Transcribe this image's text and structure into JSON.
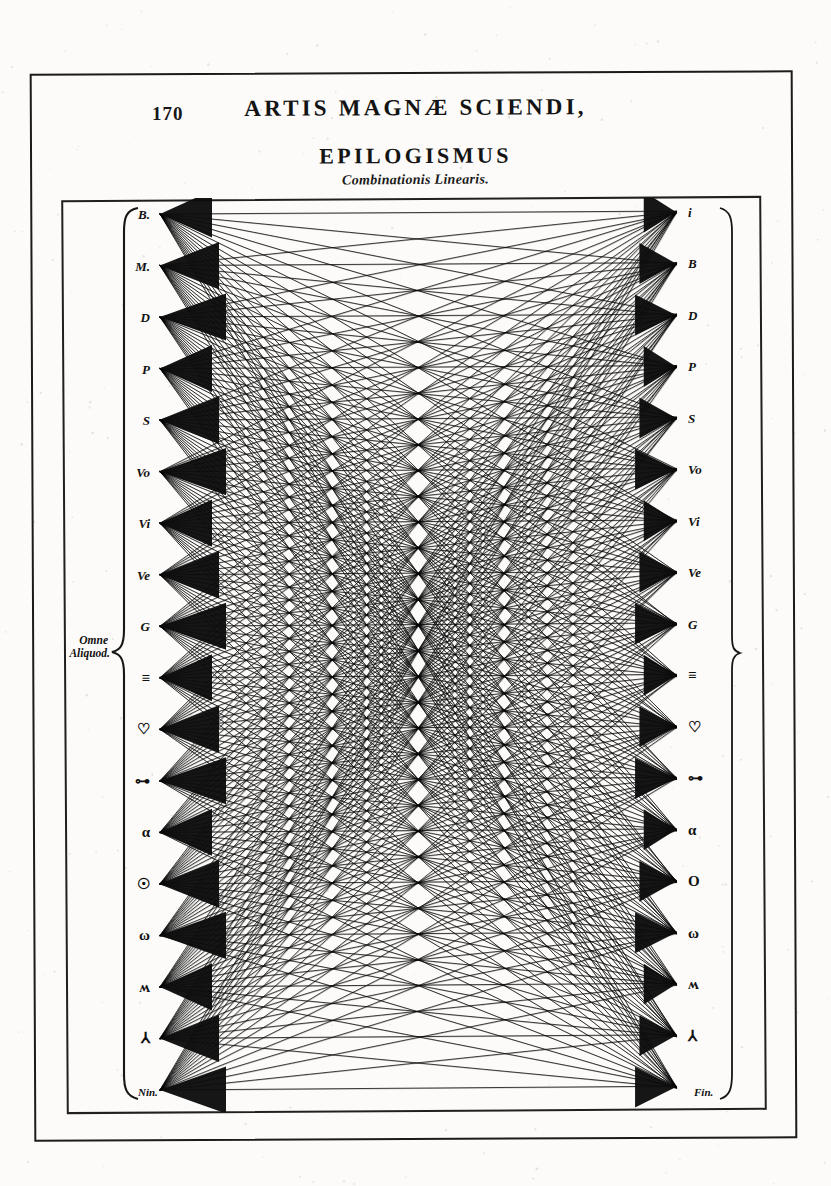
{
  "page": {
    "number": "170",
    "running_title": "ARTIS MAGNÆ SCIENDI,",
    "section_title": "EPILOGISMUS",
    "section_subtitle": "Combinationis Linearis."
  },
  "diagram": {
    "type": "complete-bipartite-line-combination",
    "brace_label_line1": "Omne",
    "brace_label_line2": "Aliquod.",
    "bottom_left_label": "Nin.",
    "bottom_right_label": "Fin.",
    "top_right_label": "i",
    "node_count": 18,
    "ink_color": "#111111",
    "paper_color": "#fcfbf9",
    "left_nodes": [
      {
        "label": "B.",
        "kind": "letter"
      },
      {
        "label": "M.",
        "kind": "letter"
      },
      {
        "label": "D",
        "kind": "letter"
      },
      {
        "label": "P",
        "kind": "letter"
      },
      {
        "label": "S",
        "kind": "letter"
      },
      {
        "label": "Vo",
        "kind": "letter"
      },
      {
        "label": "Vi",
        "kind": "letter"
      },
      {
        "label": "Ve",
        "kind": "letter"
      },
      {
        "label": "G",
        "kind": "letter"
      },
      {
        "label": "≡",
        "kind": "symbol"
      },
      {
        "label": "♡",
        "kind": "symbol"
      },
      {
        "label": "⊶",
        "kind": "symbol"
      },
      {
        "label": "α",
        "kind": "symbol"
      },
      {
        "label": "☉",
        "kind": "symbol"
      },
      {
        "label": "ω",
        "kind": "symbol"
      },
      {
        "label": "ʍ",
        "kind": "symbol"
      },
      {
        "label": "⅄",
        "kind": "symbol"
      },
      {
        "label": "",
        "kind": "blank"
      }
    ],
    "right_nodes": [
      {
        "label": "i",
        "kind": "letter"
      },
      {
        "label": "B",
        "kind": "letter"
      },
      {
        "label": "D",
        "kind": "letter"
      },
      {
        "label": "P",
        "kind": "letter"
      },
      {
        "label": "S",
        "kind": "letter"
      },
      {
        "label": "Vo",
        "kind": "letter"
      },
      {
        "label": "Vi",
        "kind": "letter"
      },
      {
        "label": "Ve",
        "kind": "letter"
      },
      {
        "label": "G",
        "kind": "letter"
      },
      {
        "label": "≡",
        "kind": "symbol"
      },
      {
        "label": "♡",
        "kind": "symbol"
      },
      {
        "label": "⊶",
        "kind": "symbol"
      },
      {
        "label": "α",
        "kind": "symbol"
      },
      {
        "label": "O",
        "kind": "symbol"
      },
      {
        "label": "ω",
        "kind": "symbol"
      },
      {
        "label": "ʍ",
        "kind": "symbol"
      },
      {
        "label": "⅄",
        "kind": "symbol"
      },
      {
        "label": "",
        "kind": "blank"
      }
    ]
  }
}
